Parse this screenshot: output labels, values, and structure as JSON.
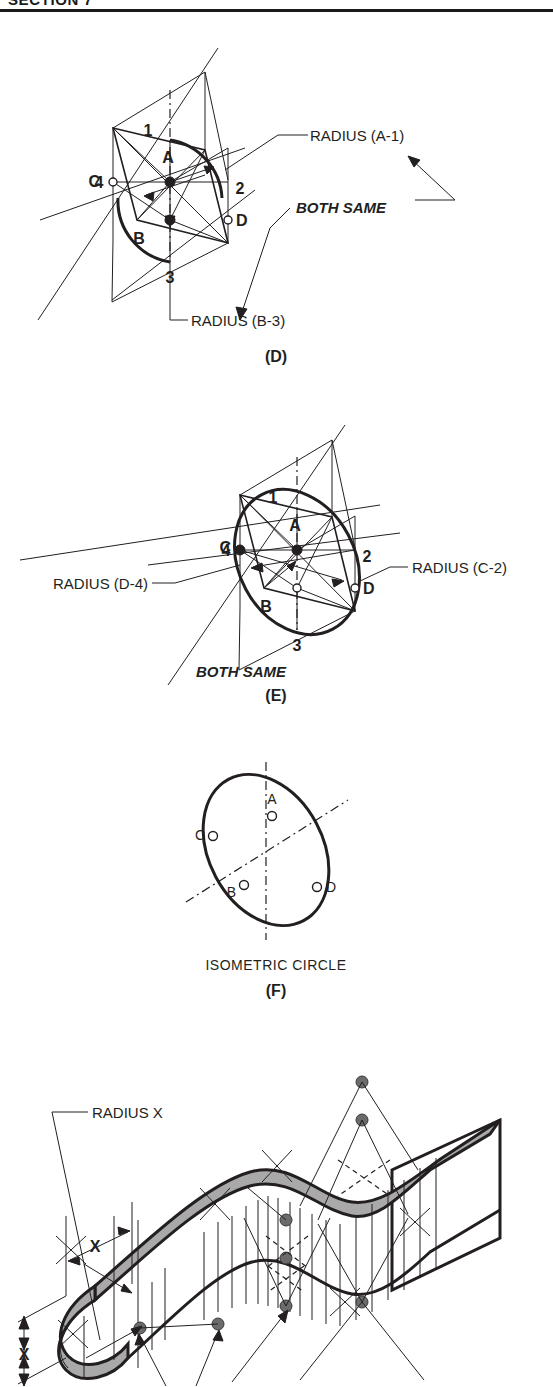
{
  "page": {
    "header_title": "SECTION 7",
    "background": "#ffffff",
    "ink": "#231f20",
    "gray_fill": "#a9a9a9"
  },
  "figures": [
    {
      "id": "D",
      "caption": "(D)",
      "point_labels": [
        "1",
        "2",
        "3",
        "4",
        "A",
        "B",
        "C",
        "D"
      ],
      "annotations": [
        {
          "name": "radius-a1",
          "text": "RADIUS (A-1)"
        },
        {
          "name": "radius-b3",
          "text": "RADIUS (B-3)"
        },
        {
          "name": "both-same",
          "text": "BOTH SAME"
        }
      ]
    },
    {
      "id": "E",
      "caption": "(E)",
      "point_labels": [
        "1",
        "2",
        "3",
        "4",
        "A",
        "B",
        "C",
        "D"
      ],
      "annotations": [
        {
          "name": "radius-d4",
          "text": "RADIUS (D-4)"
        },
        {
          "name": "radius-c2",
          "text": "RADIUS (C-2)"
        },
        {
          "name": "both-same",
          "text": "BOTH SAME"
        }
      ]
    },
    {
      "id": "F",
      "caption": "(F)",
      "title": "ISOMETRIC CIRCLE",
      "point_labels": [
        "A",
        "B",
        "C",
        "D"
      ],
      "annotations": []
    },
    {
      "id": "G",
      "caption": "",
      "point_labels": [],
      "annotations": [
        {
          "name": "radius-x",
          "text": "RADIUS X"
        },
        {
          "name": "dim-x-horizontal",
          "text": "X"
        },
        {
          "name": "dim-x-vertical",
          "text": "X"
        }
      ]
    }
  ],
  "labels": {
    "n1": "1",
    "n2": "2",
    "n3": "3",
    "n4": "4",
    "pA": "A",
    "pB": "B",
    "pC": "C",
    "pD": "D",
    "radius_a1": "RADIUS (A-1)",
    "radius_b3": "RADIUS (B-3)",
    "radius_d4": "RADIUS (D-4)",
    "radius_c2": "RADIUS (C-2)",
    "both_same": "BOTH SAME",
    "cap_d": "(D)",
    "cap_e": "(E)",
    "cap_f": "(F)",
    "isometric_circle": "ISOMETRIC CIRCLE",
    "radius_x": "RADIUS X",
    "dim_x": "X"
  }
}
